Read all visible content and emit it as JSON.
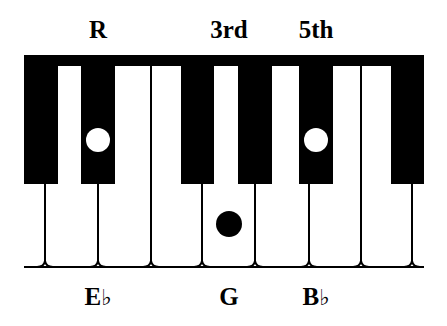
{
  "diagram": {
    "type": "piano-chord-diagram",
    "chord": "E♭ major",
    "colors": {
      "key_black": "#000000",
      "key_white": "#ffffff",
      "line": "#000000",
      "background": "#ffffff"
    }
  },
  "top_labels": [
    {
      "id": "root",
      "text": "R",
      "x": 98
    },
    {
      "id": "third",
      "text": "3rd",
      "x": 229
    },
    {
      "id": "fifth",
      "text": "5th",
      "x": 316
    }
  ],
  "bottom_labels": [
    {
      "id": "eb",
      "note": "E",
      "accidental": "♭",
      "x": 98
    },
    {
      "id": "g",
      "note": "G",
      "accidental": "",
      "x": 229
    },
    {
      "id": "bb",
      "note": "B",
      "accidental": "♭",
      "x": 316
    }
  ],
  "keyboard": {
    "left": 24,
    "right": 424,
    "top": 55,
    "bar_bottom": 66,
    "black_bottom": 184,
    "baseline": 267,
    "white_dividers": [
      45,
      98,
      151,
      202,
      255,
      309,
      361,
      412
    ],
    "black_keys": [
      {
        "note": "D♭",
        "x1": 24,
        "x2": 58
      },
      {
        "note": "E♭",
        "x1": 81,
        "x2": 115
      },
      {
        "note": "G♭",
        "x1": 181,
        "x2": 214
      },
      {
        "note": "A♭",
        "x1": 238,
        "x2": 272
      },
      {
        "note": "B♭",
        "x1": 299,
        "x2": 333
      },
      {
        "note": "D♭",
        "x1": 391,
        "x2": 424
      }
    ],
    "markers": [
      {
        "note": "E♭",
        "role": "R",
        "key": "black",
        "cx": 98,
        "cy": 140,
        "r": 12,
        "fill": "#ffffff"
      },
      {
        "note": "G",
        "role": "3rd",
        "key": "white",
        "cx": 229,
        "cy": 224,
        "r": 13,
        "fill": "#000000"
      },
      {
        "note": "B♭",
        "role": "5th",
        "key": "black",
        "cx": 316,
        "cy": 140,
        "r": 12,
        "fill": "#ffffff"
      }
    ]
  }
}
